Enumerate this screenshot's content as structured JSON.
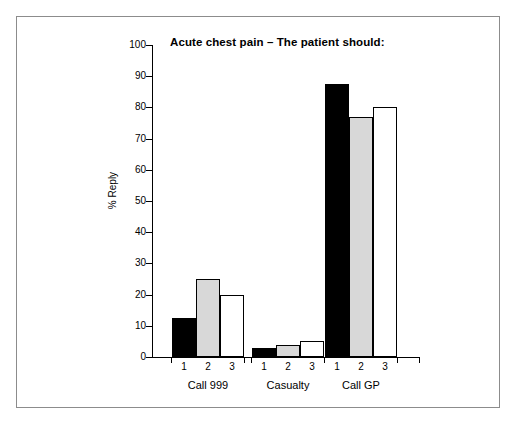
{
  "chart_data": {
    "type": "bar",
    "title": "Acute chest pain – The patient should:",
    "xlabel": "",
    "ylabel": "% Reply",
    "ylim": [
      0,
      100
    ],
    "ytick_labels": [
      "0",
      "10",
      "20",
      "30",
      "40",
      "50",
      "60",
      "70",
      "80",
      "90",
      "100"
    ],
    "ytick_values": [
      0,
      10,
      20,
      30,
      40,
      50,
      60,
      70,
      80,
      90,
      100
    ],
    "grid": false,
    "legend": "none",
    "categories": [
      "Call 999",
      "Casualty",
      "Call GP"
    ],
    "bar_index_labels": [
      "1",
      "2",
      "3"
    ],
    "series": [
      {
        "name": "1",
        "fill": "black",
        "values": [
          12.5,
          3,
          87.5
        ]
      },
      {
        "name": "2",
        "fill": "gray",
        "values": [
          25,
          4,
          77
        ]
      },
      {
        "name": "3",
        "fill": "white",
        "values": [
          20,
          5,
          80
        ]
      }
    ],
    "colors": {
      "series_1": "#000000",
      "series_2": "#d8d8d8",
      "series_3": "#ffffff",
      "outline": "#000000",
      "axis": "#000000",
      "frame": "#8c8c8c",
      "background": "#ffffff"
    }
  }
}
